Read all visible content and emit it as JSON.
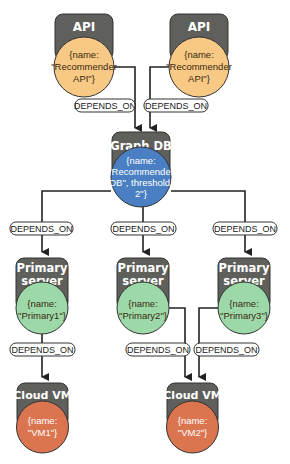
{
  "diagram": {
    "type": "dependency-graph",
    "colors": {
      "header": "#5f605c",
      "api": "#f8c985",
      "graphdb": "#4a7fc4",
      "primary": "#9dd8a8",
      "cloudvm": "#db7550",
      "edge": "#222222",
      "edge_label_border": "#333333"
    },
    "nodes": {
      "api1": {
        "type": "API",
        "props": [
          "{name:",
          "\"Recommender",
          "API\"}"
        ]
      },
      "api2": {
        "type": "API",
        "props": [
          "{name:",
          "\"Recommender",
          "API\"}"
        ]
      },
      "graphdb": {
        "type": "Graph DB",
        "props": [
          "{name:",
          "\"Recommender",
          "DB\", threshold:",
          "2\"}"
        ]
      },
      "primary1": {
        "type_line1": "Primary",
        "type_line2": "server",
        "props": [
          "{name:",
          "\"Primary1\"}"
        ]
      },
      "primary2": {
        "type_line1": "Primary",
        "type_line2": "server",
        "props": [
          "{name:",
          "\"Primary2\"}"
        ]
      },
      "primary3": {
        "type_line1": "Primary",
        "type_line2": "server",
        "props": [
          "{name:",
          "\"Primary3\"}"
        ]
      },
      "vm1": {
        "type": "Cloud VM",
        "props": [
          "{name:",
          "\"VM1\"}"
        ]
      },
      "vm2": {
        "type": "Cloud VM",
        "props": [
          "{name:",
          "\"VM2\"}"
        ]
      }
    },
    "edges": [
      {
        "from": "api1",
        "to": "graphdb",
        "label": "DEPENDS_ON"
      },
      {
        "from": "api2",
        "to": "graphdb",
        "label": "DEPENDS_ON"
      },
      {
        "from": "graphdb",
        "to": "primary1",
        "label": "DEPENDS_ON"
      },
      {
        "from": "graphdb",
        "to": "primary2",
        "label": "DEPENDS_ON"
      },
      {
        "from": "graphdb",
        "to": "primary3",
        "label": "DEPENDS_ON"
      },
      {
        "from": "primary1",
        "to": "vm1",
        "label": "DEPENDS_ON"
      },
      {
        "from": "primary2",
        "to": "vm2",
        "label": "DEPENDS_ON"
      },
      {
        "from": "primary3",
        "to": "vm2",
        "label": "DEPENDS_ON"
      }
    ]
  }
}
